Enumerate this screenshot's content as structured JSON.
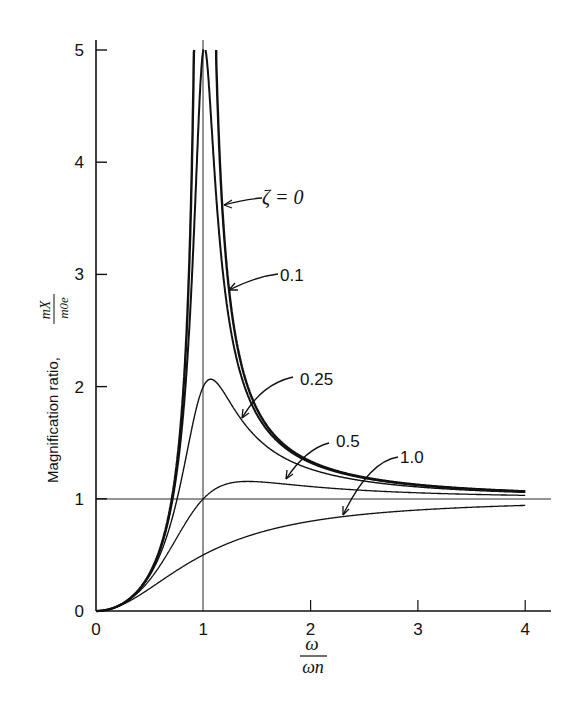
{
  "chart_data": {
    "type": "line",
    "title": "",
    "xlabel": "ω / ω_n",
    "ylabel": "Magnification ratio, mX / m0e",
    "xlim": [
      0,
      4.25
    ],
    "ylim": [
      0,
      5
    ],
    "xticks": [
      "0",
      "1",
      "2",
      "3",
      "4"
    ],
    "yticks": [
      "0",
      "1",
      "2",
      "3",
      "4",
      "5"
    ],
    "reference_lines": [
      {
        "type": "horizontal",
        "y": 1
      },
      {
        "type": "vertical",
        "x": 1
      }
    ],
    "formula": "M = r^2 / sqrt((1 - r^2)^2 + (2*zeta*r)^2)",
    "x_range_curves": [
      0,
      4
    ],
    "series": [
      {
        "name": "ζ = 0",
        "zeta": 0,
        "label": "ζ = 0",
        "peak": "∞ at r=1"
      },
      {
        "name": "0.1",
        "zeta": 0.1,
        "label": "0.1",
        "peak": 5.03
      },
      {
        "name": "0.25",
        "zeta": 0.25,
        "label": "0.25",
        "peak": 2.07
      },
      {
        "name": "0.5",
        "zeta": 0.5,
        "label": "0.5",
        "peak": 1.15
      },
      {
        "name": "1.0",
        "zeta": 1.0,
        "label": "1.0",
        "peak": "approaches 1"
      }
    ],
    "grid": false,
    "legend": "inline annotations with arrows"
  },
  "labels": {
    "ylabel_text": "Magnification ratio,",
    "ylabel_num": "mX",
    "ylabel_den": "m0e",
    "xlabel_num": "ω",
    "xlabel_den": "ωn",
    "zeta0": "ζ = 0",
    "zeta01": "0.1",
    "zeta025": "0.25",
    "zeta05": "0.5",
    "zeta10": "1.0",
    "origin": "0"
  }
}
